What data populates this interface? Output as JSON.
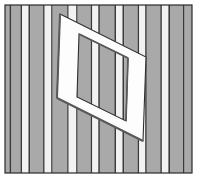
{
  "figure": {
    "type": "line-drawing-illustration",
    "width": 197,
    "height": 178,
    "caption": ""
  },
  "canvas": {
    "background_color": "#ffffff",
    "border_color": "#2b2b2b",
    "border_width": 1.2,
    "panel": {
      "x": 5,
      "y": 5,
      "width": 187,
      "height": 168
    }
  },
  "palette": {
    "stripe_gray": "#a9a9a9",
    "stripe_gray_alt": "#9d9d9d",
    "stripe_light": "#f2f2f2",
    "stripe_white": "#fbfbfb",
    "stripe_line": "#3a3a3a",
    "frame_face": "#fdfdfd",
    "frame_shadow": "#5a5a5a",
    "frame_edge": "#2e2e2e",
    "outline": "#2b2b2b"
  },
  "stripes": {
    "orientation": "vertical",
    "count": 23,
    "note": "alternating wide gray bands and narrow light bands separated by thin dark rules",
    "bands": [
      {
        "x": 5.0,
        "width": 4.5,
        "tone": "gray"
      },
      {
        "x": 9.5,
        "width": 2.0,
        "tone": "line"
      },
      {
        "x": 11.5,
        "width": 9.0,
        "tone": "gray"
      },
      {
        "x": 20.5,
        "width": 1.6,
        "tone": "line"
      },
      {
        "x": 22.1,
        "width": 6.4,
        "tone": "light"
      },
      {
        "x": 28.5,
        "width": 1.6,
        "tone": "line"
      },
      {
        "x": 30.1,
        "width": 13.0,
        "tone": "gray"
      },
      {
        "x": 43.1,
        "width": 1.6,
        "tone": "line"
      },
      {
        "x": 44.7,
        "width": 6.5,
        "tone": "light"
      },
      {
        "x": 51.2,
        "width": 1.5,
        "tone": "line"
      },
      {
        "x": 52.7,
        "width": 14.5,
        "tone": "gray"
      },
      {
        "x": 67.2,
        "width": 1.5,
        "tone": "line"
      },
      {
        "x": 68.7,
        "width": 7.5,
        "tone": "light"
      },
      {
        "x": 76.2,
        "width": 1.5,
        "tone": "line"
      },
      {
        "x": 77.7,
        "width": 13.0,
        "tone": "gray"
      },
      {
        "x": 90.7,
        "width": 1.6,
        "tone": "line"
      },
      {
        "x": 92.3,
        "width": 6.0,
        "tone": "light"
      },
      {
        "x": 98.3,
        "width": 1.6,
        "tone": "line"
      },
      {
        "x": 99.9,
        "width": 14.5,
        "tone": "gray"
      },
      {
        "x": 114.4,
        "width": 1.6,
        "tone": "line"
      },
      {
        "x": 116.0,
        "width": 6.5,
        "tone": "light"
      },
      {
        "x": 122.5,
        "width": 1.6,
        "tone": "line"
      },
      {
        "x": 124.1,
        "width": 13.5,
        "tone": "gray"
      },
      {
        "x": 137.6,
        "width": 1.6,
        "tone": "line"
      },
      {
        "x": 139.2,
        "width": 6.0,
        "tone": "light"
      },
      {
        "x": 145.2,
        "width": 1.6,
        "tone": "line"
      },
      {
        "x": 146.8,
        "width": 13.5,
        "tone": "gray"
      },
      {
        "x": 160.3,
        "width": 1.6,
        "tone": "line"
      },
      {
        "x": 161.9,
        "width": 6.5,
        "tone": "light"
      },
      {
        "x": 168.4,
        "width": 1.6,
        "tone": "line"
      },
      {
        "x": 170.0,
        "width": 13.0,
        "tone": "gray"
      },
      {
        "x": 183.0,
        "width": 1.6,
        "tone": "line"
      },
      {
        "x": 184.6,
        "width": 7.4,
        "tone": "gray"
      }
    ]
  },
  "frame": {
    "shape": "parallelogram",
    "label": "white frame",
    "outer": [
      {
        "x": 60,
        "y": 14
      },
      {
        "x": 146,
        "y": 57
      },
      {
        "x": 143,
        "y": 141
      },
      {
        "x": 57,
        "y": 98
      }
    ],
    "inner": [
      {
        "x": 79,
        "y": 34
      },
      {
        "x": 128,
        "y": 58
      },
      {
        "x": 126,
        "y": 121
      },
      {
        "x": 77,
        "y": 97
      }
    ],
    "shadow_edges": [
      {
        "from": {
          "x": 60,
          "y": 14
        },
        "to": {
          "x": 57,
          "y": 98
        },
        "width": 2.0
      },
      {
        "from": {
          "x": 57,
          "y": 98
        },
        "to": {
          "x": 143,
          "y": 141
        },
        "width": 2.0
      },
      {
        "from": {
          "x": 79,
          "y": 34
        },
        "to": {
          "x": 128,
          "y": 58
        },
        "width": 1.6
      },
      {
        "from": {
          "x": 128,
          "y": 58
        },
        "to": {
          "x": 126,
          "y": 121
        },
        "width": 1.6
      }
    ]
  }
}
